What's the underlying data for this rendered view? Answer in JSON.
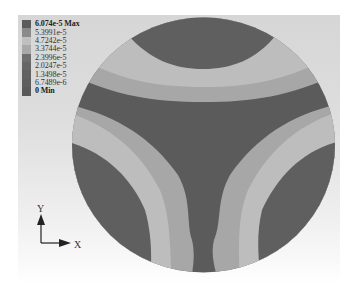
{
  "legend": {
    "entries": [
      {
        "label": "6.074e-5 Max",
        "bold": true,
        "color": "#5c5c5c"
      },
      {
        "label": "5.3991e-5",
        "bold": false,
        "color": "#8a8a8a"
      },
      {
        "label": "4.7242e-5",
        "bold": false,
        "color": "#bfbfbf"
      },
      {
        "label": "3.3744e-5",
        "bold": false,
        "color": "#a9a9a9"
      },
      {
        "label": "2.3996e-5",
        "bold": false,
        "color": "#6e6e6e"
      },
      {
        "label": "2.0247e-5",
        "bold": false,
        "color": "#666666"
      },
      {
        "label": "1.3498e-5",
        "bold": false,
        "color": "#616161"
      },
      {
        "label": "6.7489e-6",
        "bold": false,
        "color": "#5e5e5e"
      },
      {
        "label": "0 Min",
        "bold": true,
        "color": "#5a5a5a"
      }
    ]
  },
  "contour": {
    "colors": {
      "center": "#5b5b5b",
      "lobe_core": "#5f5f5f",
      "light_band": "#bdbdbd",
      "mid_band": "#a7a7a7",
      "outer_band": "#c9c9c9"
    },
    "lobes": [
      "top",
      "bottom-left",
      "bottom-right"
    ]
  },
  "axes_triad": {
    "x_label": "X",
    "y_label": "Y"
  }
}
